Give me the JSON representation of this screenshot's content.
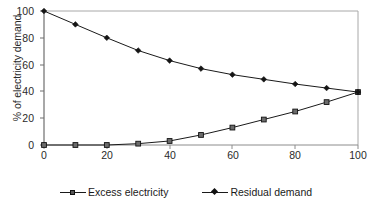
{
  "chart_data": {
    "type": "line",
    "title": "",
    "xlabel": "Wind energy coverage in % of annual electricity demand",
    "ylabel": "% of electricity demand",
    "xlim": [
      0,
      100
    ],
    "ylim": [
      0,
      100
    ],
    "xticks": [
      "0",
      "20",
      "40",
      "60",
      "80",
      "100"
    ],
    "yticks": [
      "0",
      "20",
      "40",
      "60",
      "80",
      "100"
    ],
    "grid": false,
    "legend_position": "bottom",
    "x": [
      0,
      10,
      20,
      30,
      40,
      50,
      60,
      70,
      80,
      90,
      100
    ],
    "series": [
      {
        "name": "Excess electricity",
        "marker": "square",
        "values": [
          0,
          0,
          0,
          1,
          3,
          7.5,
          13,
          19,
          25,
          32,
          39.5
        ]
      },
      {
        "name": "Residual demand",
        "marker": "diamond",
        "values": [
          100,
          90,
          80,
          70.5,
          63,
          57,
          52.5,
          49,
          45.5,
          42.5,
          39.5
        ]
      }
    ]
  },
  "axes": {
    "y_label": "% of electricity demand",
    "x_label": "Wind energy coverage in % of annual electricity demand",
    "y_tick_labels": [
      "100",
      "80",
      "60",
      "40",
      "20",
      "0"
    ],
    "x_tick_labels": [
      "0",
      "20",
      "40",
      "60",
      "80",
      "100"
    ]
  },
  "legend": {
    "items": [
      {
        "label": "Excess electricity",
        "marker": "square-marker"
      },
      {
        "label": "Residual demand",
        "marker": "diamond-marker"
      }
    ]
  },
  "colors": {
    "line": "#1a1a1a",
    "frame": "#9a9a9a",
    "axis": "#4a4a4a",
    "text": "#1a1a1a",
    "background": "#ffffff"
  }
}
